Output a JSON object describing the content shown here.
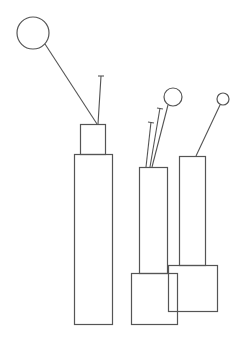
{
  "diagram": {
    "background": "#ffffff",
    "stroke_color": "#555555",
    "groups": [
      {
        "name": "left-column",
        "rects": [
          {
            "x": 80,
            "y": 124,
            "w": 25,
            "h": 30
          },
          {
            "x": 74,
            "y": 154,
            "w": 38,
            "h": 170
          }
        ],
        "circles": [
          {
            "cx": 33,
            "cy": 33,
            "r": 16
          }
        ],
        "lines": [
          {
            "x1": 45,
            "y1": 44,
            "x2": 97,
            "y2": 124
          },
          {
            "x1": 101,
            "y1": 76,
            "x2": 98,
            "y2": 124
          }
        ],
        "ticks": [
          {
            "x1": 98,
            "y1": 76,
            "x2": 104,
            "y2": 76
          }
        ]
      },
      {
        "name": "middle-column",
        "rects": [
          {
            "x": 139,
            "y": 167,
            "w": 28,
            "h": 106
          },
          {
            "x": 131,
            "y": 273,
            "w": 46,
            "h": 51
          }
        ],
        "circles": [
          {
            "cx": 173,
            "cy": 97,
            "r": 9
          }
        ],
        "lines": [
          {
            "x1": 168,
            "y1": 105,
            "x2": 152,
            "y2": 167
          },
          {
            "x1": 160,
            "y1": 108,
            "x2": 150,
            "y2": 167
          },
          {
            "x1": 151,
            "y1": 122,
            "x2": 146,
            "y2": 167
          }
        ],
        "ticks": [
          {
            "x1": 157,
            "y1": 108,
            "x2": 163,
            "y2": 109
          },
          {
            "x1": 148,
            "y1": 122,
            "x2": 154,
            "y2": 123
          }
        ]
      },
      {
        "name": "right-column",
        "rects": [
          {
            "x": 179,
            "y": 156,
            "w": 26,
            "h": 109
          },
          {
            "x": 168,
            "y": 265,
            "w": 49,
            "h": 46
          }
        ],
        "circles": [
          {
            "cx": 223,
            "cy": 99,
            "r": 6
          }
        ],
        "lines": [
          {
            "x1": 220,
            "y1": 105,
            "x2": 196,
            "y2": 156
          }
        ],
        "ticks": []
      }
    ]
  }
}
